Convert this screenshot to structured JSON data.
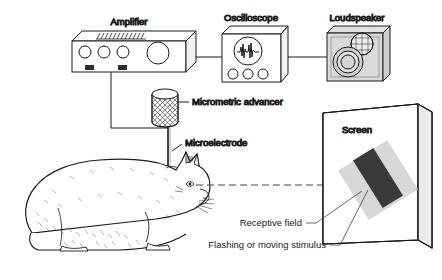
{
  "figure": {
    "background_color": "#ffffff",
    "line_color": "#1a1a1a"
  },
  "labels": {
    "amplifier": "Amplifier",
    "oscilloscope": "Oscilloscope",
    "loudspeaker": "Loudspeaker",
    "micrometric_advancer": "Micrometric advancer",
    "microelectrode": "Microelectrode",
    "screen": "Screen",
    "receptive_field": "Receptive field",
    "stimulus": "Flashing or moving stimulus"
  },
  "colors": {
    "speaker_body": "#d9d9d9",
    "receptive_field": "#d0d0d0",
    "stimulus_bar": "#3a3a3a",
    "ink": "#1a1a1a"
  },
  "components": [
    {
      "name": "amplifier",
      "knobs_small": 3,
      "knobs_large": 1,
      "jacks": 2
    },
    {
      "name": "oscilloscope",
      "knobs": 3,
      "display": "spike-waveform"
    },
    {
      "name": "loudspeaker",
      "drivers": 2
    },
    {
      "name": "micrometric-advancer",
      "shape": "hatched-cylinder"
    },
    {
      "name": "microelectrode",
      "shape": "thin-vertical-probe"
    },
    {
      "name": "cat",
      "pose": "crouching-facing-right"
    },
    {
      "name": "screen",
      "shape": "tilted-panel"
    }
  ]
}
